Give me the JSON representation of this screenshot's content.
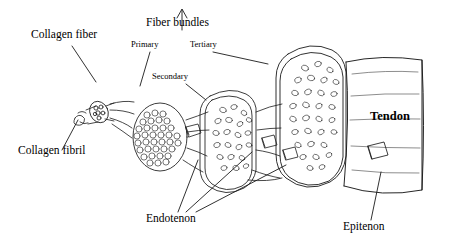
{
  "figure": {
    "type": "anatomical-diagram",
    "background_color": "#ffffff",
    "line_color": "#1a1a1a"
  },
  "labels": {
    "collagen_fiber": "Collagen fiber",
    "collagen_fibril": "Collagen fibril",
    "fiber_bundles": "Fiber bundles",
    "primary": "Primary",
    "secondary": "Secondary",
    "tertiary": "Tertiary",
    "endotenon": "Endotenon",
    "epitenon": "Epitenon",
    "tendon": "Tendon"
  }
}
